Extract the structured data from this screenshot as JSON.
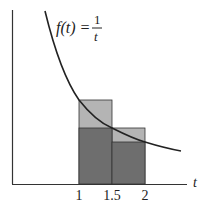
{
  "figure": {
    "function_label": "f(t) = ",
    "fraction_numerator": "1",
    "fraction_denominator": "t",
    "axis_label_x": "t",
    "ticks": [
      {
        "label": "1",
        "value": 1
      },
      {
        "label": "1.5",
        "value": 1.5
      },
      {
        "label": "2",
        "value": 2
      }
    ],
    "rectangles": [
      {
        "name": "upper-left",
        "x0": 1,
        "x1": 1.5,
        "height": 1,
        "shade": "light"
      },
      {
        "name": "lower-left",
        "x0": 1,
        "x1": 1.5,
        "height": 0.6667,
        "shade": "dark"
      },
      {
        "name": "upper-right",
        "x0": 1.5,
        "x1": 2,
        "height": 0.6667,
        "shade": "light"
      },
      {
        "name": "lower-right",
        "x0": 1.5,
        "x1": 2,
        "height": 0.5,
        "shade": "dark"
      }
    ],
    "colors": {
      "light": "#b4b4b4",
      "dark": "#6e6e6e",
      "line": "#222222"
    }
  }
}
